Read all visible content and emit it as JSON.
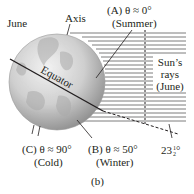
{
  "figure": {
    "panel_label": "(b)",
    "month_label": "June",
    "axis_label": "Axis",
    "equator_label": "Equator",
    "sun_rays_label": [
      "Sun’s",
      "rays",
      "(June)"
    ],
    "tilt_angle": {
      "whole": "23",
      "num": "1",
      "den": "2",
      "unit": "°"
    },
    "points": [
      {
        "id": "A",
        "line1": "(A) θ ≈ 0°",
        "line2": "(Summer)"
      },
      {
        "id": "B",
        "line1": "(B) θ ≈ 50°",
        "line2": "(Winter)"
      },
      {
        "id": "C",
        "line1": "(C) θ ≈ 90°",
        "line2": "(Cold)"
      }
    ],
    "colors": {
      "ink": "#231f20",
      "globe_light": "#e6e6e6",
      "globe_dark": "#8c8c8c",
      "ray": "#6d6d6d"
    }
  }
}
